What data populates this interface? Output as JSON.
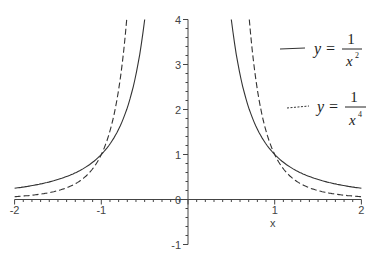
{
  "chart_data": {
    "type": "line",
    "title": "",
    "xlabel": "x",
    "ylabel": "",
    "xlim": [
      -2,
      2
    ],
    "ylim": [
      -1,
      4
    ],
    "grid": false,
    "legend_position": "upper right",
    "x_ticks": [
      "-2",
      "-1",
      "0",
      "1",
      "2"
    ],
    "y_ticks": [
      "-1",
      "0",
      "1",
      "2",
      "3",
      "4"
    ],
    "series": [
      {
        "name": "y = 1/x^2",
        "style": "solid",
        "x": [
          -2,
          -1.5,
          -1,
          -0.75,
          -0.5,
          0.5,
          0.75,
          1,
          1.5,
          2
        ],
        "values": [
          0.25,
          0.444,
          1,
          1.778,
          4,
          4,
          1.778,
          1,
          0.444,
          0.25
        ]
      },
      {
        "name": "y = 1/x^4",
        "style": "dashed",
        "x": [
          -2,
          -1.5,
          -1,
          -0.85,
          -0.707,
          0.707,
          0.85,
          1,
          1.5,
          2
        ],
        "values": [
          0.0625,
          0.198,
          1,
          1.916,
          4,
          4,
          1.916,
          1,
          0.198,
          0.0625
        ]
      }
    ]
  },
  "legend": {
    "items": [
      {
        "lhs": "y =",
        "num": "1",
        "den": "x",
        "exp": "2"
      },
      {
        "lhs": "y =",
        "num": "1",
        "den": "x",
        "exp": "4"
      }
    ]
  },
  "axis": {
    "xlabel": "x"
  }
}
